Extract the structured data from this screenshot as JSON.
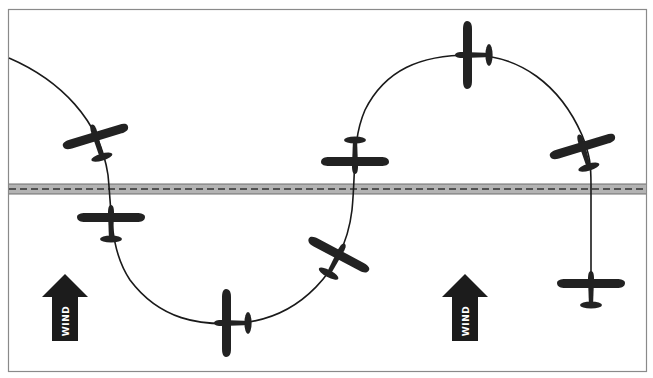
{
  "diagram": {
    "type": "s-turns-across-road",
    "colors": {
      "background": "#ffffff",
      "frame": "#8a8a8a",
      "road_fill": "#b3b3b3",
      "road_edge": "#6e6e6e",
      "road_centerline": "#333333",
      "path": "#1a1a1a",
      "aircraft": "#222222",
      "arrow": "#1c1c1c"
    },
    "road": {
      "y_top": 184,
      "y_bottom": 194
    },
    "wind_arrows": [
      {
        "label": "WIND",
        "x": 65,
        "y_tip": 274,
        "y_base": 341
      },
      {
        "label": "WIND",
        "x": 465,
        "y_tip": 274,
        "y_base": 341
      }
    ],
    "aircraft": [
      {
        "id": 1,
        "x": 96,
        "y": 138,
        "heading": 163
      },
      {
        "id": 2,
        "x": 111,
        "y": 219,
        "heading": 180
      },
      {
        "id": 3,
        "x": 228,
        "y": 323,
        "heading": 90
      },
      {
        "id": 4,
        "x": 338,
        "y": 256,
        "heading": 28
      },
      {
        "id": 5,
        "x": 355,
        "y": 157,
        "heading": 0
      },
      {
        "id": 6,
        "x": 469,
        "y": 55,
        "heading": 90
      },
      {
        "id": 7,
        "x": 583,
        "y": 150,
        "heading": 163
      },
      {
        "id": 8,
        "x": 591,
        "y": 285,
        "heading": 180
      }
    ]
  }
}
